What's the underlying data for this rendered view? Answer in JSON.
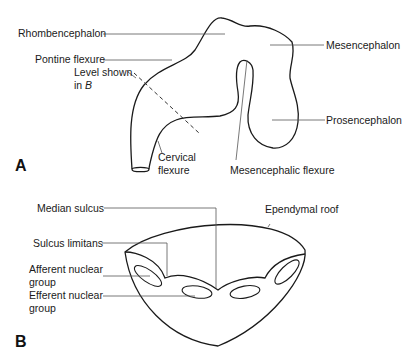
{
  "panel_a": {
    "letter": "A",
    "labels": {
      "rhombencephalon": "Rhombencephalon",
      "pontine_flexure": "Pontine flexure",
      "level_shown_1": "Level shown",
      "level_shown_2_prefix": "in ",
      "level_shown_2_ref": "B",
      "cervical_1": "Cervical",
      "cervical_2": "flexure",
      "mesencephalon": "Mesencephalon",
      "prosencephalon": "Prosencephalon",
      "mesencephalic_flexure": "Mesencephalic flexure"
    }
  },
  "panel_b": {
    "letter": "B",
    "labels": {
      "median_sulcus": "Median sulcus",
      "ependymal_roof": "Ependymal roof",
      "sulcus_limitans": "Sulcus limitans",
      "afferent_1": "Afferent nuclear",
      "afferent_2": "group",
      "efferent_1": "Efferent nuclear",
      "efferent_2": "group"
    }
  },
  "colors": {
    "outline": "#1a1a1a",
    "leader": "#555555",
    "background": "#ffffff"
  }
}
